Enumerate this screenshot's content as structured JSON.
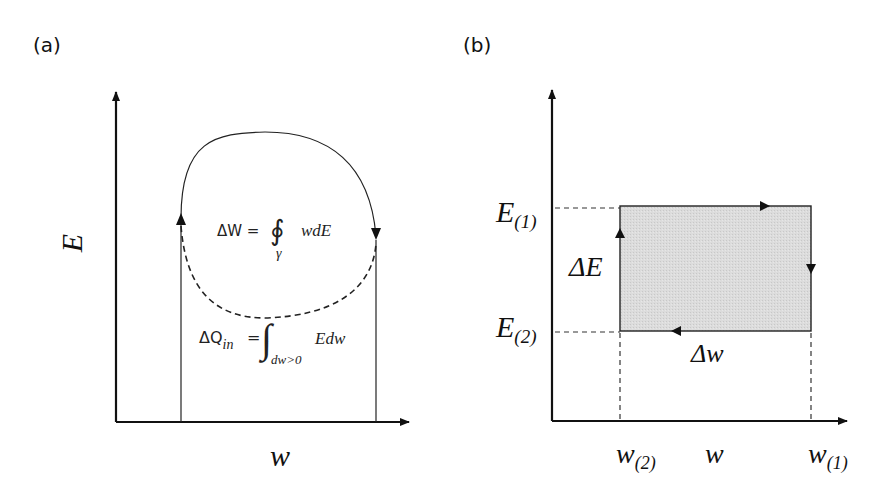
{
  "panel_a": {
    "label": "(a)",
    "y_axis_label": "E",
    "x_axis_label": "w",
    "work_formula": {
      "lhs": "ΔW =",
      "integral": "∮",
      "subscript": "γ",
      "integrand": "wdE"
    },
    "heat_formula": {
      "lhs_main": "ΔQ",
      "lhs_sub": "in",
      "equals": "=",
      "integral": "∫",
      "subscript": "dw>0",
      "integrand": "Edw"
    }
  },
  "panel_b": {
    "label": "(b)",
    "y_axis_label": "E",
    "x_axis_label": "w",
    "e1_label": {
      "main": "E",
      "sub": "(1)"
    },
    "e2_label": {
      "main": "E",
      "sub": "(2)"
    },
    "w1_label": {
      "main": "w",
      "sub": "(1)"
    },
    "w2_label": {
      "main": "w",
      "sub": "(2)"
    },
    "delta_e_label": "ΔE",
    "delta_w_label": "Δw",
    "fill_color": "#d9d9d9"
  },
  "colors": {
    "stroke": "#111111",
    "background": "#ffffff"
  }
}
